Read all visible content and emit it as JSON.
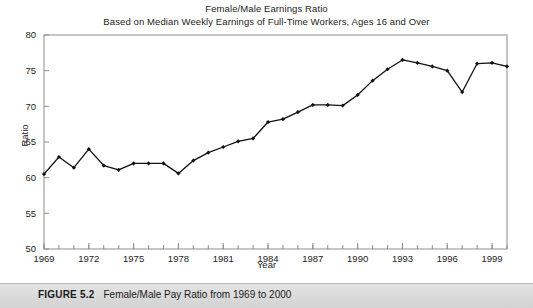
{
  "figure": {
    "caption_label": "FIGURE 5.2",
    "caption_text": "Female/Male Pay Ratio from 1969 to 2000"
  },
  "chart_data": {
    "type": "line",
    "title": "Female/Male Earnings Ratio",
    "subtitle": "Based on Median Weekly Earnings of Full-Time Workers, Ages 16 and Over",
    "xlabel": "Year",
    "ylabel": "Ratio",
    "xlim": [
      1969,
      2000
    ],
    "ylim": [
      50,
      80
    ],
    "ytick_values": [
      50,
      55,
      60,
      65,
      70,
      75,
      80
    ],
    "ytick_labels": [
      "50",
      "55",
      "60",
      "65",
      "70",
      "75",
      "80"
    ],
    "xtick_values": [
      1969,
      1972,
      1975,
      1978,
      1981,
      1984,
      1987,
      1990,
      1993,
      1996,
      1999
    ],
    "xtick_labels": [
      "1969",
      "1972",
      "1975",
      "1978",
      "1981",
      "1984",
      "1987",
      "1990",
      "1993",
      "1996",
      "1999"
    ],
    "xminor_step": 1,
    "grid": false,
    "legend": null,
    "marker": "filled-diamond",
    "line_color": "#111111",
    "x": [
      1969,
      1970,
      1971,
      1972,
      1973,
      1974,
      1975,
      1976,
      1977,
      1978,
      1979,
      1980,
      1981,
      1982,
      1983,
      1984,
      1985,
      1986,
      1987,
      1988,
      1989,
      1990,
      1991,
      1992,
      1993,
      1994,
      1995,
      1996,
      1997,
      1998,
      1999,
      2000
    ],
    "values": [
      60.5,
      62.9,
      61.4,
      64.0,
      61.7,
      61.1,
      62.0,
      62.0,
      62.0,
      60.6,
      62.4,
      63.5,
      64.3,
      65.1,
      65.5,
      67.8,
      68.2,
      69.2,
      70.2,
      70.2,
      70.1,
      71.6,
      73.6,
      75.2,
      76.5,
      76.1,
      75.6,
      75.0,
      72.0,
      76.0,
      76.1,
      75.6
    ]
  }
}
